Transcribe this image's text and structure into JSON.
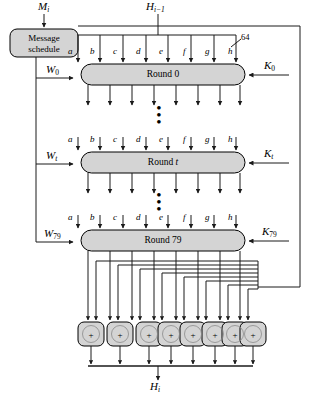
{
  "diagram": {
    "type": "block-diagram",
    "colors": {
      "block_fill": "#d4d4d4",
      "block_stroke": "#000000",
      "line": "#1a1a1a",
      "background": "#ffffff"
    }
  },
  "inputs": {
    "message_input": {
      "base": "M",
      "sub": "i",
      "label": "Mi"
    },
    "chaining_input": {
      "base": "H",
      "sub": "i−1",
      "label": "Hi-1"
    },
    "bit_width_annotation": "64"
  },
  "message_schedule": {
    "line1": "Message",
    "line2": "schedule"
  },
  "state_labels": [
    "a",
    "b",
    "c",
    "d",
    "e",
    "f",
    "g",
    "h"
  ],
  "rounds": [
    {
      "id": "round-0",
      "label": "Round 0",
      "w_base": "W",
      "w_sub": "0",
      "w_label": "W0",
      "k_base": "K",
      "k_sub": "0",
      "k_label": "K0"
    },
    {
      "id": "round-t",
      "label": "Round t",
      "label_prefix": "Round ",
      "label_italic": "t",
      "w_base": "W",
      "w_sub": "t",
      "w_label": "Wt",
      "k_base": "K",
      "k_sub": "t",
      "k_label": "Kt"
    },
    {
      "id": "round-79",
      "label": "Round 79",
      "w_base": "W",
      "w_sub": "79",
      "w_label": "W79",
      "k_base": "K",
      "k_sub": "79",
      "k_label": "K79"
    }
  ],
  "ellipses": {
    "upper": "⋮",
    "lower": "⋮",
    "dot_count": 3
  },
  "adders": {
    "count": 8,
    "symbol": "+",
    "operation": "word-wise addition mod 2^64"
  },
  "output": {
    "base": "H",
    "sub": "i",
    "label": "Hi"
  }
}
